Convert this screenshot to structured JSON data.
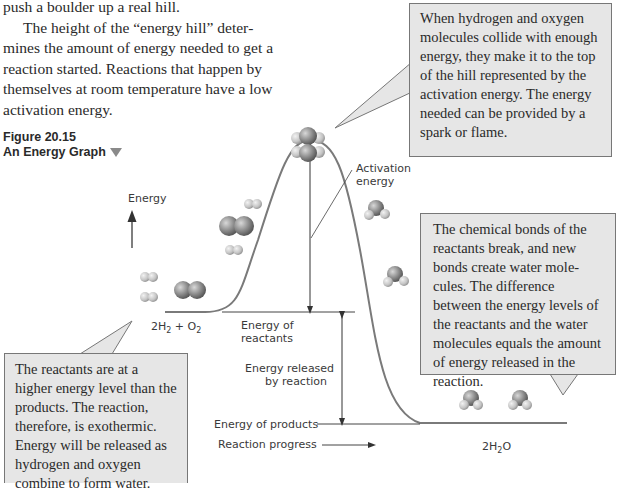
{
  "body_text": {
    "line1": "push a boulder up a real hill.",
    "paragraph": "The height of the “energy hill” deter­mines the amount of energy needed to get a reaction started. Reactions that happen by themselves at room temper­ature have a low activation energy."
  },
  "figure": {
    "number": "Figure 20.15",
    "title": "An Energy Graph"
  },
  "callouts": {
    "top_right": "When hydrogen and oxy­gen molecules collide with enough energy, they make it to the top of the hill rep­resented by the activation energy. The energy needed can be provided by a spark or flame.",
    "middle_right": "The chemical bonds of the reactants break, and new bonds create water mole­cules. The difference between the energy levels of the reactants and the water molecules equals the amount of energy released in the reaction.",
    "bottom_left": "The reactants are at a higher energy level than the products. The reaction, therefore, is exothermic. Energy will be released as hydrogen and oxygen combine to form water."
  },
  "labels": {
    "energy_axis": "Energy",
    "activation_line1": "Activation",
    "activation_line2": "energy",
    "reactants_formula": {
      "a": "2H",
      "a_sub": "2",
      "b": " + O",
      "b_sub": "2"
    },
    "products_formula": {
      "a": "2H",
      "a_sub": "2",
      "b": "O"
    },
    "energy_of_reactants_line1": "Energy of",
    "energy_of_reactants_line2": "reactants",
    "energy_released_line1": "Energy released",
    "energy_released_line2": "by reaction",
    "energy_of_products": "Energy of products",
    "reaction_progress": "Reaction progress"
  },
  "colors": {
    "callout_fill": "#e6e6e6",
    "callout_border": "#777777",
    "curve": "#7a7a7a",
    "molecule_dark": "#8a8a8a",
    "molecule_light": "#c8c8c8"
  }
}
